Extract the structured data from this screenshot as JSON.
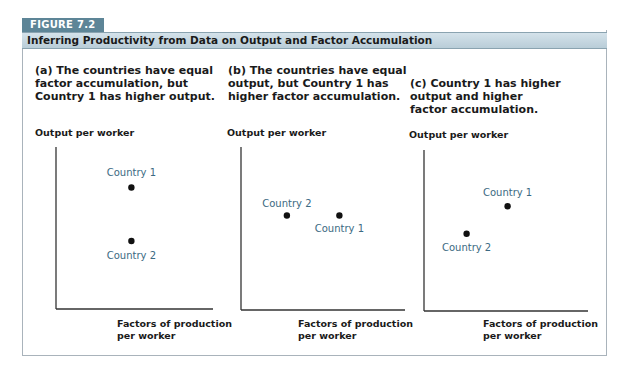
{
  "figure": {
    "badge": "FIGURE 7.2",
    "title": "Inferring Productivity from Data on Output and Factor Accumulation",
    "colors": {
      "badge_bg": "#5d8597",
      "title_bar": "#c6d7e0",
      "point_label": "#3b6a82",
      "point": "#111111"
    }
  },
  "panels": [
    {
      "caption_lines": [
        "(a) The countries have equal",
        "factor accumulation, but",
        "Country 1 has higher output."
      ],
      "ylabel": "Output per worker",
      "xlabel_lines": [
        "Factors of production",
        "per worker"
      ]
    },
    {
      "caption_lines": [
        "(b) The countries have equal",
        "output, but Country 1 has",
        "higher factor accumulation."
      ],
      "ylabel": "Output per worker",
      "xlabel_lines": [
        "Factors of production",
        "per worker"
      ]
    },
    {
      "caption_lines": [
        "(c) Country 1 has higher",
        "output and higher",
        "factor accumulation."
      ],
      "ylabel": "Output per worker",
      "xlabel_lines": [
        "Factors of production",
        "per worker"
      ]
    }
  ],
  "chart_data": [
    {
      "type": "scatter",
      "title": "(a) The countries have equal factor accumulation, but Country 1 has higher output.",
      "xlabel": "Factors of production per worker",
      "ylabel": "Output per worker",
      "grid": false,
      "xlim": [
        0,
        10
      ],
      "ylim": [
        0,
        10
      ],
      "points": [
        {
          "name": "Country 1",
          "x": 4.8,
          "y": 7.5
        },
        {
          "name": "Country 2",
          "x": 4.8,
          "y": 4.2
        }
      ]
    },
    {
      "type": "scatter",
      "title": "(b) The countries have equal output, but Country 1 has higher factor accumulation.",
      "xlabel": "Factors of production per worker",
      "ylabel": "Output per worker",
      "grid": false,
      "xlim": [
        0,
        10
      ],
      "ylim": [
        0,
        10
      ],
      "points": [
        {
          "name": "Country 2",
          "x": 2.8,
          "y": 5.8
        },
        {
          "name": "Country 1",
          "x": 6.0,
          "y": 5.8
        }
      ]
    },
    {
      "type": "scatter",
      "title": "(c) Country 1 has higher output and higher factor accumulation.",
      "xlabel": "Factors of production per worker",
      "ylabel": "Output per worker",
      "grid": false,
      "xlim": [
        0,
        10
      ],
      "ylim": [
        0,
        10
      ],
      "points": [
        {
          "name": "Country 1",
          "x": 5.1,
          "y": 6.5
        },
        {
          "name": "Country 2",
          "x": 2.6,
          "y": 4.8
        }
      ]
    }
  ]
}
